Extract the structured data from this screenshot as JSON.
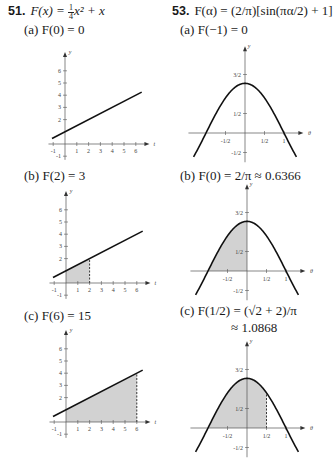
{
  "problems": [
    {
      "number": "51.",
      "function": "F(x) = ¼x² + x",
      "function_parts": {
        "lhs": "F(x) = ",
        "coef_num": "1",
        "coef_den": "4",
        "rest": "x² + x"
      },
      "parts": [
        {
          "label": "(a)",
          "text": "F(0) = 0"
        },
        {
          "label": "(b)",
          "text": "F(2) = 3"
        },
        {
          "label": "(c)",
          "text": "F(6) = 15"
        }
      ]
    },
    {
      "number": "53.",
      "function": "F(α) = (2/π)[sin(πα/2) + 1]",
      "parts": [
        {
          "label": "(a)",
          "text": "F(−1) = 0"
        },
        {
          "label": "(b)",
          "text": "F(0) = 2/π ≈ 0.6366"
        },
        {
          "label": "(c)",
          "text": "F(1/2) = (√2 + 2)/π",
          "text2": "≈ 1.0868"
        }
      ]
    }
  ],
  "chart_data": [
    {
      "type": "area",
      "title": "(a) F(0) = 0",
      "curve": "y = x/2 + 1",
      "x": [
        -1,
        6.5
      ],
      "y": [
        0.5,
        4.25
      ],
      "shaded_interval": [
        0,
        0
      ],
      "xlabel": "t",
      "ylabel": "y",
      "xticks": [
        "-1",
        "1",
        "2",
        "3",
        "4",
        "5",
        "6"
      ],
      "yticks": [
        "-1",
        "2",
        "3",
        "4",
        "5",
        "6"
      ],
      "xlim": [
        -1,
        6.5
      ],
      "ylim": [
        -1,
        7
      ],
      "grid": false
    },
    {
      "type": "area",
      "title": "(b) F(2) = 3",
      "curve": "y = x/2 + 1",
      "x": [
        -1,
        6.5
      ],
      "y": [
        0.5,
        4.25
      ],
      "shaded_interval": [
        0,
        2
      ],
      "xlabel": "t",
      "ylabel": "y",
      "xticks": [
        "-1",
        "1",
        "2",
        "3",
        "4",
        "5",
        "6"
      ],
      "yticks": [
        "-1",
        "2",
        "3",
        "4",
        "5",
        "6"
      ],
      "xlim": [
        -1,
        6.5
      ],
      "ylim": [
        -1,
        7
      ],
      "grid": false
    },
    {
      "type": "area",
      "title": "(c) F(6) = 15",
      "curve": "y = x/2 + 1",
      "x": [
        -1,
        6.5
      ],
      "y": [
        0.5,
        4.25
      ],
      "shaded_interval": [
        0,
        6
      ],
      "xlabel": "t",
      "ylabel": "y",
      "xticks": [
        "-1",
        "1",
        "2",
        "3",
        "4",
        "5",
        "6"
      ],
      "yticks": [
        "-1",
        "2",
        "3",
        "4",
        "5",
        "6"
      ],
      "xlim": [
        -1,
        6.5
      ],
      "ylim": [
        -1,
        7
      ],
      "grid": false
    },
    {
      "type": "area",
      "title": "(a) F(−1) = 0",
      "curve": "y = cos(πθ/2)·(2/π)·... (shown as cos-shaped arch, peak ≈ 1.27 at θ=0, zeros at θ=±1)",
      "shaded_interval": [
        -1,
        -1
      ],
      "xlabel": "θ",
      "ylabel": "y",
      "xticks": [
        "-1/2",
        "1/2",
        "1"
      ],
      "yticks": [
        "3/2",
        "1/2",
        "-1/2"
      ],
      "xlim": [
        -1.3,
        1.4
      ],
      "ylim": [
        -0.7,
        1.9
      ],
      "grid": false
    },
    {
      "type": "area",
      "title": "(b) F(0) = 2/π ≈ 0.6366",
      "shaded_interval": [
        -1,
        0
      ],
      "xlabel": "θ",
      "ylabel": "y",
      "xticks": [
        "-1/2",
        "1/2",
        "1"
      ],
      "yticks": [
        "3/2",
        "1/2",
        "-1/2"
      ],
      "xlim": [
        -1.3,
        1.4
      ],
      "ylim": [
        -0.7,
        1.9
      ],
      "grid": false
    },
    {
      "type": "area",
      "title": "(c) F(1/2) = (√2 + 2)/π ≈ 1.0868",
      "shaded_interval": [
        -1,
        0.5
      ],
      "xlabel": "θ",
      "ylabel": "y",
      "xticks": [
        "-1/2",
        "1/2",
        "1"
      ],
      "yticks": [
        "3/2",
        "1/2",
        "-1/2"
      ],
      "xlim": [
        -1.3,
        1.4
      ],
      "ylim": [
        -0.7,
        1.9
      ],
      "grid": false
    }
  ]
}
